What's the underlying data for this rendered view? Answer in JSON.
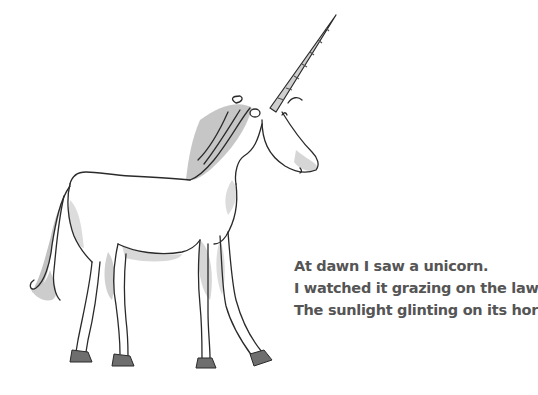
{
  "scene": {
    "subject": "unicorn",
    "style": "ink-and-watercolor sketch",
    "colors": {
      "background": "#ffffff",
      "ink": "#2a2a2a",
      "wash": "#bdbdbd",
      "wash_light": "#dedede",
      "hoof": "#6e6e6e",
      "text": "#555555"
    }
  },
  "poem": {
    "lines": [
      "At dawn I saw a unicorn.",
      "I watched it grazing on the lawn,",
      "The sunlight glinting on its horn."
    ]
  }
}
